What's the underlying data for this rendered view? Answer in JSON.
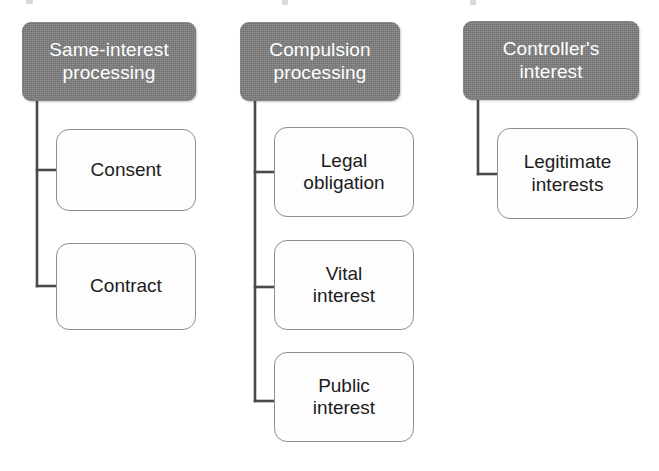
{
  "diagram": {
    "background_color": "#ffffff",
    "header_fill": "#7e7e7e",
    "header_text_color": "#ffffff",
    "leaf_fill": "#fdfdfd",
    "leaf_border_color": "#8e8e8e",
    "connector_color": "#4a4a4a",
    "columns": [
      {
        "id": "same-interest",
        "header": "Same-interest\nprocessing",
        "children": [
          {
            "id": "consent",
            "label": "Consent"
          },
          {
            "id": "contract",
            "label": "Contract"
          }
        ]
      },
      {
        "id": "compulsion",
        "header": "Compulsion\nprocessing",
        "children": [
          {
            "id": "legal-obligation",
            "label": "Legal\nobligation"
          },
          {
            "id": "vital-interest",
            "label": "Vital\ninterest"
          },
          {
            "id": "public-interest",
            "label": "Public\ninterest"
          }
        ]
      },
      {
        "id": "controllers-interest",
        "header": "Controller's\ninterest",
        "children": [
          {
            "id": "legitimate-interests",
            "label": "Legitimate\ninterests"
          }
        ]
      }
    ]
  }
}
